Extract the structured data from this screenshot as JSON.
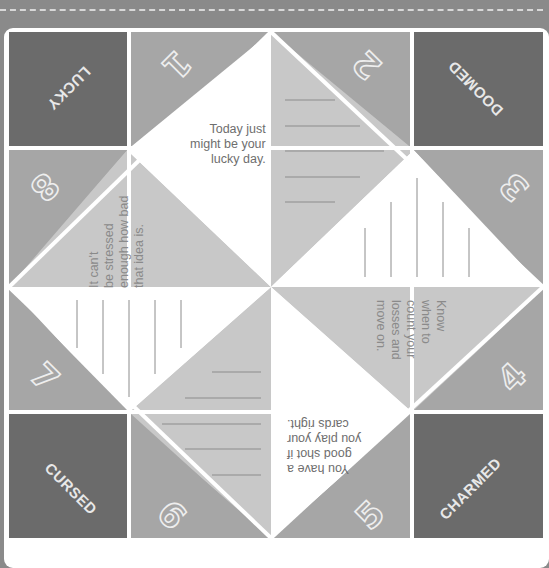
{
  "colors": {
    "background": "#8a8a8a",
    "corner_square": "#6b6b6b",
    "number_triangle": "#a6a6a6",
    "light_triangle": "#c8c8c8",
    "white_triangle": "#ffffff",
    "line": "#8c8c8c"
  },
  "corners": {
    "top_left": "LUCKY",
    "top_right": "DOOMED",
    "bottom_left": "CURSED",
    "bottom_right": "CHARMED"
  },
  "numbers": [
    "1",
    "2",
    "3",
    "4",
    "5",
    "6",
    "7",
    "8"
  ],
  "fortunes": {
    "top": "Today just\nmight be your\nlucky day.",
    "left": "It can't\nbe stressed\nenough how bad\nthat idea is.",
    "right": "Know\nwhen to\ncount your\nlosses and\nmove on.",
    "bottom": "You have a\ngood shot if\nyou play your\ncards right."
  },
  "blank_panels": [
    "top-right-lines",
    "right-top-lines",
    "left-bottom-lines",
    "bottom-left-lines"
  ]
}
